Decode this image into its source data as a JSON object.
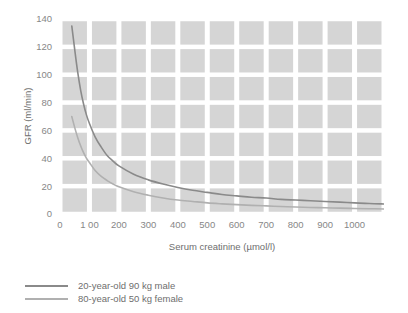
{
  "chart_data": {
    "type": "line",
    "title": "",
    "subtitle": "",
    "xlabel": "Serum creatinine (µmol/l)",
    "ylabel": "GFR (ml/min)",
    "xlim": [
      0,
      1100
    ],
    "ylim": [
      0,
      140
    ],
    "xticks": [
      0,
      100,
      200,
      300,
      400,
      500,
      600,
      700,
      800,
      900,
      1000
    ],
    "xticklabels": [
      "0",
      "1 00",
      "200",
      "300",
      "400",
      "500",
      "600",
      "700",
      "800",
      "900",
      "1000"
    ],
    "yticks": [
      0,
      20,
      40,
      60,
      80,
      100,
      120,
      140
    ],
    "yticklabels": [
      "0",
      "20",
      "40",
      "60",
      "80",
      "100",
      "120",
      "140"
    ],
    "grid": "checkerboard-blocks",
    "legend_position": "below-left",
    "series": [
      {
        "name": "20-year-old 90 kg male",
        "color": "#8a8a8a",
        "x": [
          40,
          50,
          60,
          70,
          80,
          90,
          100,
          120,
          140,
          160,
          180,
          200,
          250,
          300,
          350,
          400,
          450,
          500,
          550,
          600,
          650,
          700,
          750,
          800,
          850,
          900,
          950,
          1000,
          1050,
          1100
        ],
        "y": [
          135,
          118,
          102,
          89,
          79,
          71,
          65,
          55,
          48,
          42,
          38,
          34.5,
          28.5,
          24.5,
          21.5,
          19,
          17,
          15.5,
          14,
          13,
          12,
          11.5,
          10.5,
          10,
          9.5,
          9,
          8.5,
          8,
          7.5,
          7.2
        ]
      },
      {
        "name": "80-year-old 50 kg female",
        "color": "#b0b0b0",
        "x": [
          40,
          50,
          60,
          70,
          80,
          90,
          100,
          120,
          140,
          160,
          180,
          200,
          250,
          300,
          350,
          400,
          450,
          500,
          550,
          600,
          650,
          700,
          750,
          800,
          850,
          900,
          950,
          1000,
          1050,
          1100
        ],
        "y": [
          70,
          62,
          55,
          49,
          44,
          40,
          37,
          31,
          27,
          24,
          21.5,
          19.5,
          16,
          13.5,
          11.5,
          10,
          9,
          8,
          7.3,
          6.7,
          6.2,
          5.8,
          5.4,
          5,
          4.7,
          4.5,
          4.2,
          4,
          3.8,
          3.6
        ]
      }
    ],
    "colors": {
      "grid_block": "#d5d5d5",
      "plot_background": "#ffffff",
      "axis_text": "#878787",
      "series_male": "#8a8a8a",
      "series_female": "#b0b0b0"
    }
  },
  "legend": {
    "items": [
      {
        "label": "20-year-old 90 kg male",
        "color": "#8a8a8a"
      },
      {
        "label": "80-year-old 50 kg female",
        "color": "#b0b0b0"
      }
    ]
  }
}
